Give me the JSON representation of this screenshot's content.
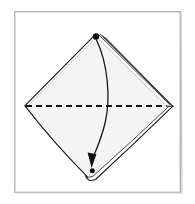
{
  "figure": {
    "title": "Origami fold step diagram",
    "canvas": {
      "width": 195,
      "height": 204,
      "background": "#ffffff"
    },
    "frame": {
      "name": "figure-border",
      "x": 14,
      "y": 11,
      "width": 167,
      "height": 182,
      "stroke": "#b4b4b4",
      "stroke_width": 1.4,
      "fill": "#ffffff"
    },
    "shape": {
      "name": "paper-diamond",
      "fill": "#f4f4f4",
      "stroke": "#1a1a1a",
      "stroke_width": 1.1,
      "vertices": {
        "top": {
          "x": 96,
          "y": 35
        },
        "right": {
          "x": 166,
          "y": 106
        },
        "bottom": {
          "x": 92,
          "y": 178
        },
        "left": {
          "x": 25,
          "y": 106
        }
      },
      "outline_path": "M 96 35 L 166 106 L 92 178 Q 80 170 25 106 Z"
    },
    "layered_edges": {
      "name": "folded-layer-lines",
      "description": "Four to five parallel lines along the upper-right edge indicating stacked paper layers",
      "count": 5,
      "stroke": "#2b2b2b",
      "stroke_width": 0.9,
      "offsets": [
        0,
        2.6,
        5.2,
        7.8,
        10.4
      ]
    },
    "dotted_edges": {
      "name": "hidden-edge-dotted-lines",
      "description": "Dotted secondary lines tracing the upper-left and upper-right edges just inside the outline",
      "stroke": "#8a8a8a",
      "stroke_width": 0.9,
      "dash": "1 1.7"
    },
    "fold_line": {
      "name": "valley-fold-dashed-line",
      "type": "valley-fold",
      "stroke": "#101010",
      "stroke_width": 2.1,
      "dash": "6 4",
      "x1": 26,
      "y1": 106,
      "x2": 165,
      "y2": 106
    },
    "arrow": {
      "name": "fold-direction-arrow",
      "description": "Curved arrow from the top corner dot bulging right then sweeping down to the bottom corner dot",
      "stroke": "#111111",
      "stroke_width": 1.2,
      "path": "M 96 39 C 107 62 110 96 105 120 C 101 140 96 150 92 158",
      "head": {
        "name": "arrowhead",
        "fill": "#111111",
        "points": "92 167 88.4 152.6 96.2 153.4"
      }
    },
    "markers": [
      {
        "name": "top-corner-dot",
        "x": 96,
        "y": 36,
        "r": 3.1,
        "fill": "#0d0d0d"
      },
      {
        "name": "bottom-corner-dot",
        "x": 92.5,
        "y": 170.5,
        "r": 2.5,
        "fill": "#0d0d0d"
      }
    ],
    "colors": {
      "ink": "#111111",
      "paper_fill": "#f4f4f4",
      "frame_stroke": "#b4b4b4",
      "dotted_gray": "#8a8a8a",
      "page_background": "#ffffff"
    }
  }
}
